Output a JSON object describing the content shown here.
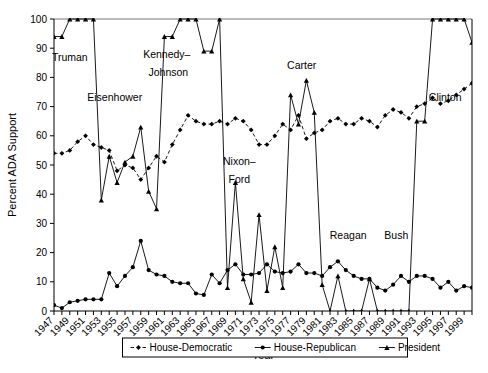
{
  "chart_data": {
    "type": "line",
    "title": "",
    "xlabel": "Year",
    "ylabel": "Percent ADA Support",
    "xlim": [
      1947,
      2000
    ],
    "ylim": [
      0,
      100
    ],
    "yticks": [
      0,
      10,
      20,
      30,
      40,
      50,
      60,
      70,
      80,
      90,
      100
    ],
    "grid": false,
    "legend_position": "bottom-center",
    "x": [
      1947,
      1948,
      1949,
      1950,
      1951,
      1952,
      1953,
      1954,
      1955,
      1956,
      1957,
      1958,
      1959,
      1960,
      1961,
      1962,
      1963,
      1964,
      1965,
      1966,
      1967,
      1968,
      1969,
      1970,
      1971,
      1972,
      1973,
      1974,
      1975,
      1976,
      1977,
      1978,
      1979,
      1980,
      1981,
      1982,
      1983,
      1984,
      1985,
      1986,
      1987,
      1988,
      1989,
      1990,
      1991,
      1992,
      1993,
      1994,
      1995,
      1996,
      1997,
      1998,
      1999,
      2000
    ],
    "xtick_labels": [
      "1947",
      "1949",
      "1951",
      "1953",
      "1955",
      "1957",
      "1959",
      "1961",
      "1963",
      "1965",
      "1967",
      "1969",
      "1971",
      "1973",
      "1975",
      "1977",
      "1979",
      "1981",
      "1983",
      "1985",
      "1987",
      "1989",
      "1991",
      "1993",
      "1995",
      "1997",
      "1999"
    ],
    "xtick_values": [
      1947,
      1949,
      1951,
      1953,
      1955,
      1957,
      1959,
      1961,
      1963,
      1965,
      1967,
      1969,
      1971,
      1973,
      1975,
      1977,
      1979,
      1981,
      1983,
      1985,
      1987,
      1989,
      1991,
      1993,
      1995,
      1997,
      1999
    ],
    "series": [
      {
        "name": "House-Democratic",
        "marker": "diamond",
        "dash": "dashed",
        "color": "#000000",
        "values": [
          54,
          54,
          55,
          58,
          60,
          57,
          56,
          55,
          48,
          50,
          49,
          45,
          49,
          53,
          51,
          57,
          62,
          67,
          65,
          64,
          64,
          65,
          64,
          66,
          65,
          62,
          57,
          57,
          60,
          64,
          62,
          67,
          59,
          61,
          62,
          65,
          66,
          64,
          64,
          66,
          65,
          63,
          67,
          69,
          68,
          66,
          70,
          71,
          73,
          71,
          72,
          74,
          76,
          78
        ]
      },
      {
        "name": "House-Republican",
        "marker": "circle",
        "dash": "solid",
        "color": "#000000",
        "values": [
          2,
          1,
          3,
          3.5,
          4,
          4,
          4,
          13,
          8.5,
          12,
          15,
          24,
          14,
          12.5,
          12,
          10,
          9.5,
          9.5,
          6,
          5.5,
          12.5,
          9.5,
          14,
          16,
          12.5,
          12.5,
          13,
          16,
          13.5,
          13,
          13.5,
          16,
          13,
          13,
          12,
          15,
          17,
          14,
          12,
          11,
          11,
          8,
          7,
          9,
          12,
          10,
          12,
          12,
          11,
          8,
          10,
          7,
          8.5,
          8
        ]
      },
      {
        "name": "President",
        "marker": "triangle",
        "dash": "solid",
        "color": "#000000",
        "values": [
          94,
          94,
          100,
          100,
          100,
          100,
          38,
          53,
          44,
          51,
          53,
          63,
          41,
          35,
          94,
          94,
          100,
          100,
          100,
          89,
          89,
          100,
          8,
          44,
          11,
          3,
          33,
          7,
          22,
          8,
          74,
          64,
          79,
          68,
          9,
          0,
          12,
          0,
          0,
          0,
          11,
          0,
          0,
          0,
          0,
          0,
          65,
          65,
          100,
          100,
          100,
          100,
          100,
          92
        ]
      }
    ],
    "annotations": [
      {
        "text": "Truman",
        "x": 1949.0,
        "y": 85.5
      },
      {
        "text": "Eisenhower",
        "x": 1954.7,
        "y": 72.0
      },
      {
        "text": "Kennedy–",
        "x": 1961.3,
        "y": 86.5
      },
      {
        "text": "Johnson",
        "x": 1961.5,
        "y": 80.5
      },
      {
        "text": "Nixon–",
        "x": 1970.5,
        "y": 50.0
      },
      {
        "text": "Ford",
        "x": 1970.5,
        "y": 44.0
      },
      {
        "text": "Carter",
        "x": 1978.4,
        "y": 83.0
      },
      {
        "text": "Reagan",
        "x": 1984.3,
        "y": 24.5
      },
      {
        "text": "Bush",
        "x": 1990.4,
        "y": 24.5
      },
      {
        "text": "Clinton",
        "x": 1996.6,
        "y": 72.0
      }
    ]
  },
  "legend": {
    "items": [
      {
        "label": "House-Democratic",
        "marker": "diamond",
        "dash": "dashed"
      },
      {
        "label": "House-Republican",
        "marker": "circle",
        "dash": "solid"
      },
      {
        "label": "President",
        "marker": "triangle",
        "dash": "solid"
      }
    ]
  }
}
